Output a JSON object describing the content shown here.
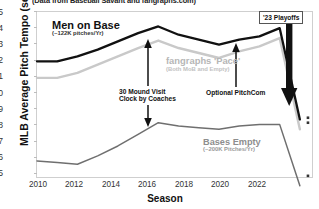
{
  "caption": "(Data from Baseball Savant and fangraphs.com)",
  "axes": {
    "ylabel": "MLB Average Pitch Tempo (secs)",
    "xlabel": "Season",
    "yticks": [
      "25",
      "24",
      "23",
      "22",
      "21",
      "20",
      "19",
      "18",
      "17",
      "16",
      "15"
    ],
    "xticks": [
      "2010",
      "2012",
      "2014",
      "2016",
      "2018",
      "2020",
      "2022"
    ]
  },
  "annotations": {
    "men_on_base": {
      "label": "Men on Base",
      "sub": "(~122K pitches/Yr)"
    },
    "fangraphs_pace": {
      "label": "fangraphs 'Pace'",
      "sub": "(Both MoB and Empty)"
    },
    "bases_empty": {
      "label": "Bases Empty",
      "sub": "(~200K Pitches/Yr)"
    },
    "mound_visit": {
      "line1": "30 Mound Visit",
      "line2": "Clock by Coaches"
    },
    "pitchcom": {
      "label": "Optional PitchCom"
    },
    "playoffs": {
      "label": "'23 Playoffs"
    }
  },
  "colors": {
    "men_on_base": "#111111",
    "fangraphs_pace": "#c9c9c9",
    "bases_empty": "#6f6f6f",
    "frame": "#cfcfcf",
    "arrow": "#111111"
  },
  "chart_data": {
    "type": "line",
    "title": "(Data from Baseball Savant and fangraphs.com)",
    "xlabel": "Season",
    "ylabel": "MLB Average Pitch Tempo (secs)",
    "xlim": [
      2010,
      2023.6
    ],
    "ylim": [
      15,
      25
    ],
    "grid": false,
    "legend": "annotations-inline",
    "x": [
      2010,
      2011,
      2012,
      2013,
      2014,
      2015,
      2016,
      2017,
      2018,
      2019,
      2020,
      2021,
      2022,
      2023
    ],
    "series": [
      {
        "name": "Men on Base",
        "note": "(~122K pitches/Yr)",
        "color": "#111111",
        "values": [
          22.0,
          22.0,
          22.3,
          22.7,
          23.2,
          23.7,
          24.1,
          23.6,
          23.3,
          23.0,
          23.3,
          23.5,
          24.0,
          18.5
        ]
      },
      {
        "name": "fangraphs 'Pace'",
        "note": "(Both MoB and Empty)",
        "color": "#c9c9c9",
        "values": [
          21.0,
          21.0,
          21.3,
          21.8,
          22.3,
          22.8,
          23.25,
          22.8,
          22.5,
          22.2,
          22.6,
          22.9,
          23.4,
          17.9
        ]
      },
      {
        "name": "Bases Empty",
        "note": "(~200K Pitches/Yr)",
        "color": "#6f6f6f",
        "values": [
          16.0,
          15.9,
          15.8,
          16.3,
          16.9,
          17.6,
          18.3,
          18.1,
          18.0,
          17.9,
          18.1,
          18.2,
          18.2,
          14.5
        ]
      }
    ],
    "markers": [
      {
        "label": "'23 Playoffs",
        "x": 2023.4,
        "y": 18.6,
        "series": "Men on Base"
      },
      {
        "label": "'23 Playoffs",
        "x": 2023.4,
        "y": 18.3,
        "series": "fangraphs 'Pace'"
      },
      {
        "label": "'23 Playoffs",
        "x": 2023.4,
        "y": 15.1,
        "series": "Bases Empty"
      }
    ],
    "event_annotations": [
      {
        "label": "30 Mound Visit Clock by Coaches",
        "x": 2016
      },
      {
        "label": "Optional PitchCom",
        "x": 2022
      },
      {
        "label": "'23 Playoffs",
        "x": 2023.4
      }
    ]
  }
}
